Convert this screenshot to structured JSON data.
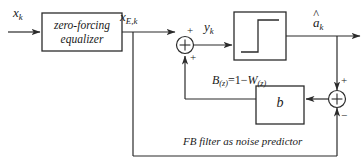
{
  "diagram": {
    "type": "block-diagram",
    "caption": "FB filter as noise predictor",
    "stroke_color": "#2b2b2b",
    "background_color": "#ffffff",
    "blocks": [
      {
        "id": "equalizer",
        "label_line1": "zero-forcing",
        "label_line2": "equalizer",
        "x": 42,
        "y": 13,
        "w": 80,
        "h": 38
      },
      {
        "id": "decision-device",
        "label": "",
        "symbol": "step-function",
        "x": 234,
        "y": 12,
        "w": 52,
        "h": 48
      },
      {
        "id": "feedback-filter",
        "label": "b",
        "x": 256,
        "y": 86,
        "w": 48,
        "h": 38
      }
    ],
    "adders": [
      {
        "id": "sum-left",
        "cx": 185,
        "cy": 45,
        "sign_top": "+",
        "sign_bottom": "+"
      },
      {
        "id": "sum-right",
        "cx": 337,
        "cy": 99,
        "sign_top": "+",
        "sign_bottom": "−"
      }
    ],
    "signals": {
      "input": "x",
      "input_sub": "k",
      "equalizer_output": "x",
      "equalizer_output_sub": "E,k",
      "adder_output": "y",
      "adder_output_sub": "k",
      "decision_output": "a",
      "decision_output_sub": "k",
      "decision_output_accent": "^"
    },
    "equation": {
      "lhs": "B",
      "lhs_arg": "(z)",
      "relation": "=1−",
      "rhs": "W",
      "rhs_arg": "(z)",
      "full_text": "B(z)=1−W(z)"
    }
  }
}
